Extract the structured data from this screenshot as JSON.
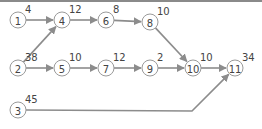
{
  "diagram": {
    "type": "network-graph",
    "colors": {
      "edge": "#8c8c8c",
      "node_stroke": "#9a9a9a",
      "text": "#444444",
      "top_border": "#8a8a8a"
    },
    "nodes": [
      {
        "id": "1",
        "label": "1",
        "weight": "4",
        "x": 18,
        "y": 20
      },
      {
        "id": "2",
        "label": "2",
        "weight": "38",
        "x": 18,
        "y": 68
      },
      {
        "id": "3",
        "label": "3",
        "weight": "45",
        "x": 18,
        "y": 110
      },
      {
        "id": "4",
        "label": "4",
        "weight": "12",
        "x": 62,
        "y": 20
      },
      {
        "id": "5",
        "label": "5",
        "weight": "10",
        "x": 62,
        "y": 68
      },
      {
        "id": "6",
        "label": "6",
        "weight": "8",
        "x": 106,
        "y": 20
      },
      {
        "id": "7",
        "label": "7",
        "weight": "12",
        "x": 106,
        "y": 68
      },
      {
        "id": "8",
        "label": "8",
        "weight": "10",
        "x": 150,
        "y": 22
      },
      {
        "id": "9",
        "label": "9",
        "weight": "2",
        "x": 150,
        "y": 68
      },
      {
        "id": "10",
        "label": "10",
        "weight": "10",
        "x": 193,
        "y": 68
      },
      {
        "id": "11",
        "label": "11",
        "weight": "34",
        "x": 235,
        "y": 68
      }
    ],
    "edges": [
      {
        "from": "1",
        "to": "4"
      },
      {
        "from": "2",
        "to": "4"
      },
      {
        "from": "4",
        "to": "6"
      },
      {
        "from": "6",
        "to": "8"
      },
      {
        "from": "8",
        "to": "10"
      },
      {
        "from": "2",
        "to": "5"
      },
      {
        "from": "5",
        "to": "7"
      },
      {
        "from": "7",
        "to": "9"
      },
      {
        "from": "9",
        "to": "10"
      },
      {
        "from": "10",
        "to": "11"
      },
      {
        "from": "3",
        "to": "11",
        "via": [
          [
            192,
            111
          ]
        ]
      }
    ]
  }
}
